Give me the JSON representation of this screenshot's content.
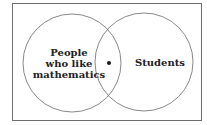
{
  "diagram": {
    "type": "venn",
    "sets": [
      {
        "label_lines": [
          "People",
          "who like",
          "mathematics"
        ]
      },
      {
        "label_lines": [
          "Students"
        ]
      }
    ],
    "intersection_marker": "dot",
    "colors": {
      "stroke": "#6e6e6e",
      "text": "#222222",
      "dot": "#1a1a1a",
      "background": "#ffffff"
    }
  }
}
